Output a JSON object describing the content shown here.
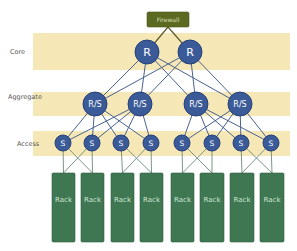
{
  "colors": {
    "band": "#f6e8b6",
    "node": "#3b5b98",
    "rack": "#3e7752",
    "firewall": "#5b6a20",
    "link": "#4a628f"
  },
  "firewall": {
    "label": "Firewall",
    "x": 147,
    "y": 12,
    "w": 42,
    "h": 15
  },
  "layers": [
    {
      "id": "core",
      "label": "Core",
      "label_x": 10,
      "label_y": 52,
      "band": {
        "x": 33,
        "y": 33,
        "w": 257,
        "h": 37
      }
    },
    {
      "id": "aggregate",
      "label": "Aggregate",
      "label_x": 8,
      "label_y": 97,
      "band": {
        "x": 33,
        "y": 92,
        "w": 257,
        "h": 24
      }
    },
    {
      "id": "access",
      "label": "Access",
      "label_x": 17,
      "label_y": 144,
      "band": {
        "x": 33,
        "y": 131,
        "w": 257,
        "h": 25
      }
    }
  ],
  "core_nodes": [
    {
      "label": "R",
      "x": 147,
      "y": 52
    },
    {
      "label": "R",
      "x": 190,
      "y": 52
    }
  ],
  "aggregate_nodes": [
    {
      "label": "R/S",
      "x": 95,
      "y": 104
    },
    {
      "label": "R/S",
      "x": 140,
      "y": 104
    },
    {
      "label": "R/S",
      "x": 196,
      "y": 104
    },
    {
      "label": "R/S",
      "x": 240,
      "y": 104
    }
  ],
  "access_nodes": [
    {
      "label": "S",
      "x": 63,
      "y": 143
    },
    {
      "label": "S",
      "x": 92,
      "y": 143
    },
    {
      "label": "S",
      "x": 121,
      "y": 143
    },
    {
      "label": "S",
      "x": 151,
      "y": 143
    },
    {
      "label": "S",
      "x": 182,
      "y": 143
    },
    {
      "label": "S",
      "x": 212,
      "y": 143
    },
    {
      "label": "S",
      "x": 241,
      "y": 143
    },
    {
      "label": "S",
      "x": 271,
      "y": 143
    }
  ],
  "racks": [
    {
      "label": "Rack",
      "x": 52,
      "y": 173,
      "w": 23,
      "h": 69
    },
    {
      "label": "Rack",
      "x": 81,
      "y": 173,
      "w": 23,
      "h": 69
    },
    {
      "label": "Rack",
      "x": 111,
      "y": 173,
      "w": 23,
      "h": 69
    },
    {
      "label": "Rack",
      "x": 140,
      "y": 173,
      "w": 23,
      "h": 69
    },
    {
      "label": "Rack",
      "x": 171,
      "y": 173,
      "w": 23,
      "h": 69
    },
    {
      "label": "Rack",
      "x": 200,
      "y": 173,
      "w": 24,
      "h": 69
    },
    {
      "label": "Rack",
      "x": 230,
      "y": 173,
      "w": 24,
      "h": 69
    },
    {
      "label": "Rack",
      "x": 260,
      "y": 173,
      "w": 24,
      "h": 69
    }
  ],
  "links": {
    "firewall_to_core": "all",
    "core_to_aggregate": "full-mesh",
    "aggregate_to_access": "full-mesh-per-pod",
    "access_to_rack": "paired-cross"
  }
}
